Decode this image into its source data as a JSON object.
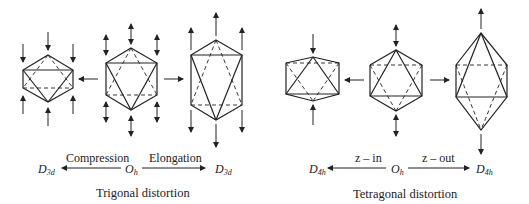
{
  "trigonal": {
    "compression_label": "Compression",
    "elongation_label": "Elongation",
    "left_symbol": "D",
    "left_symbol_sub": "3d",
    "center_symbol": "O",
    "center_symbol_sub": "h",
    "right_symbol": "D",
    "right_symbol_sub": "3d",
    "title": "Trigonal distortion"
  },
  "tetragonal": {
    "zin_label": "z – in",
    "zout_label": "z – out",
    "left_symbol": "D",
    "left_symbol_sub": "4h",
    "center_symbol": "O",
    "center_symbol_sub": "h",
    "right_symbol": "D",
    "right_symbol_sub": "4h",
    "title": "Tetragonal distortion"
  },
  "colors": {
    "ink": "#222222",
    "background": "#ffffff"
  }
}
